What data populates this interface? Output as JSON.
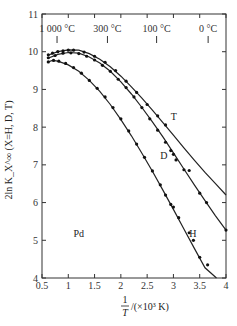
{
  "chart_data": {
    "type": "line",
    "title": "",
    "xlabel_num": "1",
    "xlabel_den": "T",
    "xlabel_unit": "/(×10³ K)",
    "ylabel": "2ln K_X^∞ (X=H, D, T)",
    "xlim": [
      0.5,
      4
    ],
    "ylim": [
      4,
      11
    ],
    "x_ticks": [
      0.5,
      1,
      1.5,
      2,
      2.5,
      3,
      3.5,
      4
    ],
    "x_tick_labels": [
      "0.5",
      "1",
      "1.5",
      "2",
      "2.5",
      "3",
      "3.5",
      "4"
    ],
    "y_ticks": [
      4,
      5,
      6,
      7,
      8,
      9,
      10,
      11
    ],
    "y_tick_labels": [
      "4",
      "5",
      "6",
      "7",
      "8",
      "9",
      "10",
      "11"
    ],
    "top_temperature_marks": [
      {
        "label": "1 000 °C",
        "x": 0.786
      },
      {
        "label": "300 °C",
        "x": 1.745
      },
      {
        "label": "100 °C",
        "x": 2.68
      },
      {
        "label": "0 °C",
        "x": 3.66
      }
    ],
    "annotations": [
      {
        "text": "Pd",
        "x": 1.1,
        "y": 5.1
      },
      {
        "text": "T",
        "x": 2.95,
        "y": 8.2
      },
      {
        "text": "D",
        "x": 2.75,
        "y": 7.15
      },
      {
        "text": "H",
        "x": 3.3,
        "y": 5.1
      }
    ],
    "series": [
      {
        "name": "T",
        "curve": [
          [
            0.6,
            9.9
          ],
          [
            0.8,
            10.0
          ],
          [
            1.0,
            10.05
          ],
          [
            1.2,
            10.04
          ],
          [
            1.4,
            9.95
          ],
          [
            1.6,
            9.8
          ],
          [
            1.8,
            9.6
          ],
          [
            2.0,
            9.35
          ],
          [
            2.2,
            9.07
          ],
          [
            2.4,
            8.77
          ],
          [
            2.6,
            8.45
          ],
          [
            2.8,
            8.12
          ],
          [
            3.0,
            7.79
          ],
          [
            3.2,
            7.45
          ],
          [
            3.4,
            7.12
          ],
          [
            3.6,
            6.8
          ],
          [
            3.8,
            6.5
          ],
          [
            4.0,
            6.2
          ]
        ],
        "points": [
          [
            0.62,
            9.92
          ],
          [
            0.7,
            9.96
          ],
          [
            0.8,
            10.0
          ],
          [
            0.9,
            10.02
          ],
          [
            1.0,
            10.04
          ],
          [
            1.1,
            10.04
          ],
          [
            1.3,
            9.99
          ],
          [
            1.5,
            9.88
          ],
          [
            1.7,
            9.72
          ],
          [
            1.9,
            9.5
          ],
          [
            2.1,
            9.22
          ],
          [
            2.3,
            8.92
          ],
          [
            2.5,
            8.6
          ],
          [
            2.7,
            8.3
          ],
          [
            2.85,
            8.06
          ]
        ]
      },
      {
        "name": "D",
        "curve": [
          [
            0.6,
            9.82
          ],
          [
            0.8,
            9.93
          ],
          [
            1.0,
            9.98
          ],
          [
            1.2,
            9.96
          ],
          [
            1.4,
            9.86
          ],
          [
            1.6,
            9.7
          ],
          [
            1.8,
            9.48
          ],
          [
            2.0,
            9.2
          ],
          [
            2.2,
            8.88
          ],
          [
            2.4,
            8.52
          ],
          [
            2.6,
            8.14
          ],
          [
            2.8,
            7.74
          ],
          [
            3.0,
            7.32
          ],
          [
            3.2,
            6.89
          ],
          [
            3.4,
            6.46
          ],
          [
            3.6,
            6.05
          ],
          [
            3.8,
            5.65
          ],
          [
            4.0,
            5.27
          ]
        ],
        "points": [
          [
            0.62,
            9.84
          ],
          [
            0.75,
            9.9
          ],
          [
            0.9,
            9.96
          ],
          [
            1.05,
            9.97
          ],
          [
            1.2,
            9.95
          ],
          [
            1.35,
            9.88
          ],
          [
            1.5,
            9.78
          ],
          [
            1.65,
            9.64
          ],
          [
            1.8,
            9.48
          ],
          [
            1.95,
            9.27
          ],
          [
            2.1,
            9.05
          ],
          [
            2.25,
            8.8
          ],
          [
            2.4,
            8.52
          ],
          [
            2.55,
            8.22
          ],
          [
            2.7,
            7.92
          ],
          [
            2.85,
            7.6
          ],
          [
            2.95,
            7.38
          ],
          [
            3.0,
            7.28
          ],
          [
            3.05,
            7.13
          ],
          [
            3.2,
            6.87
          ],
          [
            3.3,
            6.85
          ],
          [
            3.5,
            6.25
          ],
          [
            3.63,
            6.0
          ],
          [
            4.0,
            5.27
          ]
        ]
      },
      {
        "name": "H",
        "curve": [
          [
            0.6,
            9.72
          ],
          [
            0.7,
            9.77
          ],
          [
            0.8,
            9.75
          ],
          [
            1.0,
            9.65
          ],
          [
            1.2,
            9.48
          ],
          [
            1.4,
            9.24
          ],
          [
            1.6,
            8.95
          ],
          [
            1.8,
            8.6
          ],
          [
            2.0,
            8.2
          ],
          [
            2.2,
            7.77
          ],
          [
            2.4,
            7.31
          ],
          [
            2.6,
            6.83
          ],
          [
            2.8,
            6.33
          ],
          [
            3.0,
            5.82
          ],
          [
            3.2,
            5.3
          ],
          [
            3.4,
            4.78
          ],
          [
            3.6,
            4.27
          ],
          [
            3.82,
            4.0
          ]
        ],
        "points": [
          [
            0.62,
            9.73
          ],
          [
            0.72,
            9.77
          ],
          [
            0.82,
            9.75
          ],
          [
            0.95,
            9.69
          ],
          [
            1.1,
            9.58
          ],
          [
            1.25,
            9.43
          ],
          [
            1.4,
            9.24
          ],
          [
            1.55,
            9.03
          ],
          [
            1.7,
            8.8
          ],
          [
            1.85,
            8.52
          ],
          [
            2.0,
            8.22
          ],
          [
            2.15,
            7.9
          ],
          [
            2.3,
            7.55
          ],
          [
            2.45,
            7.2
          ],
          [
            2.6,
            6.84
          ],
          [
            2.75,
            6.47
          ],
          [
            2.85,
            6.2
          ],
          [
            2.95,
            5.95
          ],
          [
            3.0,
            5.88
          ],
          [
            3.1,
            5.6
          ],
          [
            3.3,
            5.2
          ],
          [
            3.38,
            5.0
          ],
          [
            3.5,
            4.55
          ],
          [
            3.65,
            4.35
          ]
        ]
      }
    ]
  }
}
